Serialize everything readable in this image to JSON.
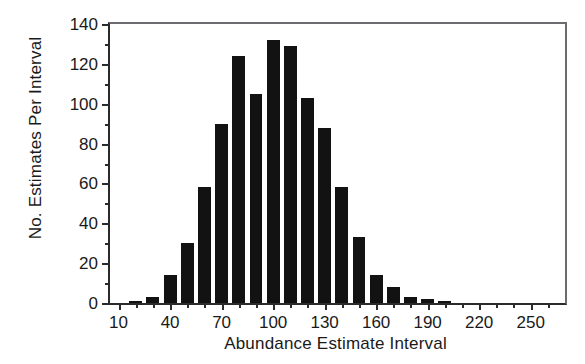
{
  "chart_data": {
    "type": "bar",
    "title": "",
    "subtitle": "",
    "xlabel": "Abundance Estimate Interval",
    "ylabel": "No. Estimates Per Interval",
    "xlim": [
      5,
      270
    ],
    "ylim": [
      0,
      140
    ],
    "grid": false,
    "legend": null,
    "bar_color": "#121212",
    "axis_color": "#2b2b2b",
    "x_ticks_major": [
      10,
      40,
      70,
      100,
      130,
      160,
      190,
      220,
      250
    ],
    "x_ticks_minor": [
      20,
      30,
      50,
      60,
      80,
      90,
      110,
      120,
      140,
      150,
      170,
      180,
      200,
      210,
      230,
      240,
      260
    ],
    "y_ticks_major": [
      0,
      20,
      40,
      60,
      80,
      100,
      120,
      140
    ],
    "y_ticks_minor": [
      10,
      30,
      50,
      70,
      90,
      110,
      130
    ],
    "categories": [
      10,
      20,
      30,
      40,
      50,
      60,
      70,
      80,
      90,
      100,
      110,
      120,
      130,
      140,
      150,
      160,
      170,
      180,
      190,
      200,
      210,
      220,
      230,
      240,
      250,
      260
    ],
    "values": [
      0,
      1,
      3,
      14,
      30,
      58,
      90,
      124,
      105,
      132,
      129,
      103,
      88,
      58,
      33,
      14,
      8,
      3,
      2,
      1,
      0,
      0,
      0,
      0,
      0,
      0
    ],
    "bar_width_units": 7.5
  }
}
